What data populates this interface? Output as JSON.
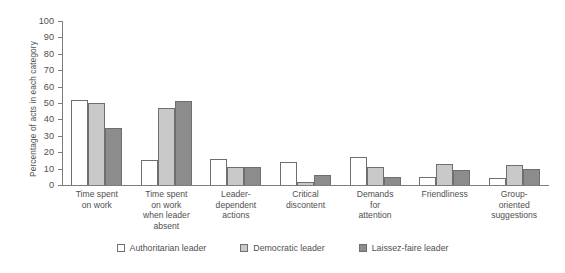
{
  "chart_data": {
    "type": "bar",
    "title": "",
    "xlabel": "",
    "ylabel": "Percentage of acts in each category",
    "ylim": [
      0,
      100
    ],
    "ytick_labels": [
      "100",
      "90",
      "80",
      "70",
      "60",
      "50",
      "40",
      "30",
      "20",
      "10",
      "0"
    ],
    "ytick_values": [
      100,
      90,
      80,
      70,
      60,
      50,
      40,
      30,
      20,
      10,
      0
    ],
    "grid": false,
    "legend_position": "bottom-center",
    "categories": [
      "Time spent\non work",
      "Time spent\non work\nwhen leader\nabsent",
      "Leader-\ndependent\nactions",
      "Critical\ndiscontent",
      "Demands\nfor\nattention",
      "Friendliness",
      "Group-\noriented\nsuggestions"
    ],
    "series": [
      {
        "name": "Authoritarian leader",
        "color": "#ffffff",
        "values": [
          52,
          15,
          16,
          14,
          17,
          5,
          4
        ]
      },
      {
        "name": "Democratic leader",
        "color": "#c9c9c9",
        "values": [
          50,
          47,
          11,
          2,
          11,
          13,
          12
        ]
      },
      {
        "name": "Laissez-faire leader",
        "color": "#8c8c8c",
        "values": [
          35,
          51,
          11,
          6,
          5,
          9,
          10
        ]
      }
    ]
  },
  "legend": {
    "items": [
      {
        "label": "Authoritarian leader"
      },
      {
        "label": "Democratic leader"
      },
      {
        "label": "Laissez-faire leader"
      }
    ]
  }
}
